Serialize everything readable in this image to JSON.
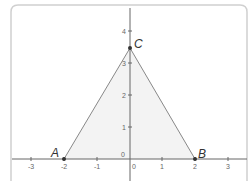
{
  "diagram": {
    "type": "coordinate-plane-triangle",
    "points": [
      {
        "label": "A",
        "x": -2,
        "y": 0
      },
      {
        "label": "B",
        "x": 2,
        "y": 0
      },
      {
        "label": "C",
        "x": 0,
        "y": 3.46
      }
    ],
    "x_ticks": [
      "-3",
      "-2",
      "-1",
      "0",
      "1",
      "2",
      "3"
    ],
    "y_ticks": [
      "0",
      "1",
      "2",
      "3",
      "4"
    ],
    "colors": {
      "fill": "#f3f3f3",
      "edge": "#888888",
      "axis": "#666666",
      "frame": "#cccccc",
      "point": "#333333"
    }
  }
}
